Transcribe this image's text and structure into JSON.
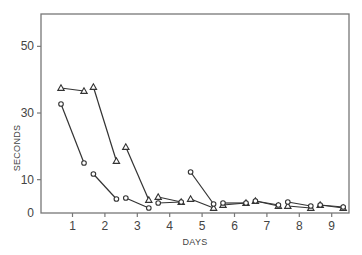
{
  "chart_data": {
    "type": "line",
    "title": "",
    "xlabel": "DAYS",
    "ylabel": "SECONDS",
    "xlim": [
      0,
      9.5
    ],
    "ylim": [
      0,
      60
    ],
    "x_ticks": [
      "1",
      "2",
      "3",
      "4",
      "5",
      "6",
      "7",
      "8",
      "9"
    ],
    "y_ticks": [
      "0",
      "10",
      "30",
      "50"
    ],
    "grid": false,
    "legend": null,
    "note": "Each day shows two paired measurements (first and last trial) connected by a line segment, for two series.",
    "series": [
      {
        "name": "triangles",
        "marker": "triangle",
        "segments": [
          {
            "day": 1,
            "start": 37.5,
            "end": 36.6
          },
          {
            "day": 2,
            "start": 37.8,
            "end": 15.6
          },
          {
            "day": 3,
            "start": 19.8,
            "end": 3.9
          },
          {
            "day": 4,
            "start": 4.8,
            "end": 3.3
          },
          {
            "day": 5,
            "start": 4.2,
            "end": 1.5
          },
          {
            "day": 6,
            "start": 2.4,
            "end": 3.0
          },
          {
            "day": 7,
            "start": 3.6,
            "end": 2.1
          },
          {
            "day": 8,
            "start": 2.1,
            "end": 1.5
          },
          {
            "day": 9,
            "start": 2.4,
            "end": 1.5
          }
        ]
      },
      {
        "name": "circles",
        "marker": "circle",
        "segments": [
          {
            "day": 1,
            "start": 32.7,
            "end": 15.0
          },
          {
            "day": 2,
            "start": 11.7,
            "end": 4.2
          },
          {
            "day": 3,
            "start": 4.5,
            "end": 1.5
          },
          {
            "day": 4,
            "start": 3.0,
            "end": 3.3
          },
          {
            "day": 5,
            "start": 12.3,
            "end": 2.7
          },
          {
            "day": 6,
            "start": 3.0,
            "end": 3.0
          },
          {
            "day": 7,
            "start": 3.6,
            "end": 2.4
          },
          {
            "day": 8,
            "start": 3.3,
            "end": 2.1
          },
          {
            "day": 9,
            "start": 2.4,
            "end": 1.8
          }
        ]
      }
    ]
  },
  "axes": {
    "xlabel": "DAYS",
    "ylabel": "SECONDS"
  }
}
